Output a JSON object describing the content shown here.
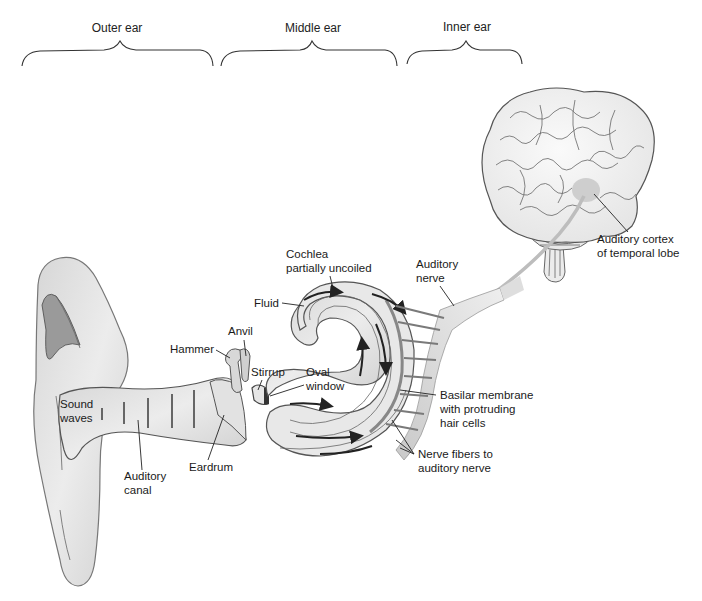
{
  "sections": [
    {
      "label": "Outer ear"
    },
    {
      "label": "Middle ear"
    },
    {
      "label": "Inner ear"
    }
  ],
  "labels": {
    "cochlea_line1": "Cochlea",
    "cochlea_line2": "partially uncoiled",
    "fluid": "Fluid",
    "anvil": "Anvil",
    "hammer": "Hammer",
    "stirrup": "Stirrup",
    "oval_window_line1": "Oval",
    "oval_window_line2": "window",
    "sound_waves_line1": "Sound",
    "sound_waves_line2": "waves",
    "auditory_canal_line1": "Auditory",
    "auditory_canal_line2": "canal",
    "eardrum": "Eardrum",
    "auditory_nerve_line1": "Auditory",
    "auditory_nerve_line2": "nerve",
    "basilar_line1": "Basilar membrane",
    "basilar_line2": "with protruding",
    "basilar_line3": "hair cells",
    "nerve_fibers_line1": "Nerve fibers to",
    "nerve_fibers_line2": "auditory nerve",
    "cortex_line1": "Auditory cortex",
    "cortex_line2": "of temporal lobe"
  },
  "colors": {
    "tissue": "#e4e4e4",
    "tissue_dark": "#bdbdbd",
    "line": "#555555",
    "cortex_highlight": "#c8c8c8"
  }
}
